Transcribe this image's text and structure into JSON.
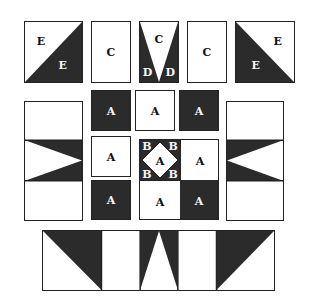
{
  "diagram": {
    "colors": {
      "dark": "#2b2b2b",
      "light": "#ffffff",
      "outline": "#222222"
    },
    "top_row": {
      "pieces": [
        {
          "id": "E-square-left",
          "labels": [
            "E",
            "E"
          ],
          "desc": "half-square triangle, dark lower-right"
        },
        {
          "id": "C-rect-1",
          "labels": [
            "C"
          ]
        },
        {
          "id": "D-flying",
          "labels": [
            "C",
            "D",
            "D"
          ],
          "desc": "white inverted triangle with two dark side triangles"
        },
        {
          "id": "C-rect-2",
          "labels": [
            "C"
          ]
        },
        {
          "id": "E-square-right",
          "labels": [
            "E",
            "E"
          ],
          "desc": "half-square triangle, dark lower-left"
        }
      ]
    },
    "middle": {
      "left_column": {
        "id": "side-unit-left",
        "desc": "tall rectangle with dark band, white triangle pointing right"
      },
      "right_column": {
        "id": "side-unit-right",
        "desc": "tall rectangle with dark band, white triangle pointing left"
      },
      "a_squares": [
        {
          "pos": "top-left",
          "label": "A",
          "shade": "dark"
        },
        {
          "pos": "top-center",
          "label": "A",
          "shade": "light"
        },
        {
          "pos": "top-right",
          "label": "A",
          "shade": "dark"
        },
        {
          "pos": "mid-left",
          "label": "A",
          "shade": "light"
        },
        {
          "pos": "bottom-left",
          "label": "A",
          "shade": "dark"
        }
      ],
      "center_block": {
        "square_in_square": {
          "center_label": "A",
          "corner_labels": [
            "B",
            "B",
            "B",
            "B"
          ]
        },
        "cells": [
          {
            "pos": "top-right",
            "label": "A",
            "shade": "light"
          },
          {
            "pos": "bottom-left",
            "label": "A",
            "shade": "light"
          },
          {
            "pos": "bottom-right",
            "label": "A",
            "shade": "dark"
          }
        ]
      }
    },
    "bottom_strip": {
      "id": "assembled-row",
      "segments": [
        "E triangle (dark upper-right)",
        "C blank",
        "D flying geese (dark sides)",
        "C blank",
        "E triangle (dark upper-left)"
      ]
    }
  }
}
